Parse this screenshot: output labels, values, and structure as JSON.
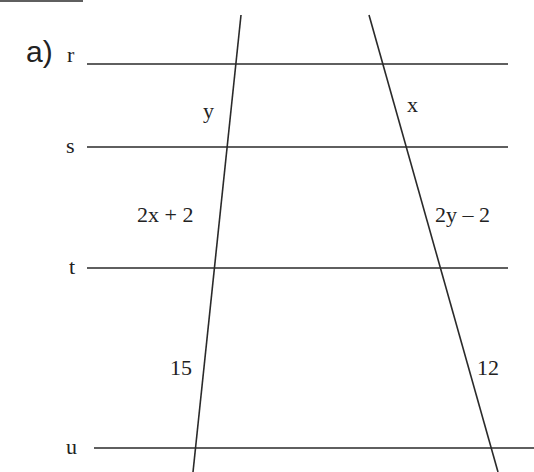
{
  "part_label": "a)",
  "parallel_lines": [
    {
      "name": "r",
      "y": 64,
      "x1": 87,
      "x2": 508
    },
    {
      "name": "s",
      "y": 147,
      "x1": 87,
      "x2": 508
    },
    {
      "name": "t",
      "y": 268,
      "x1": 87,
      "x2": 508
    },
    {
      "name": "u",
      "y": 448,
      "x1": 94,
      "x2": 534
    }
  ],
  "transversals": [
    {
      "name": "left",
      "x1": 241,
      "y1": 15,
      "x2": 193,
      "y2": 472
    },
    {
      "name": "right",
      "x1": 369,
      "y1": 15,
      "x2": 498,
      "y2": 472
    }
  ],
  "segment_labels": {
    "left_rs": "y",
    "right_rs": "x",
    "left_st": "2x + 2",
    "right_st": "2y – 2",
    "left_tu": "15",
    "right_tu": "12"
  },
  "colors": {
    "stroke": "#2a2a2a",
    "text": "#222222",
    "background": "#ffffff"
  }
}
